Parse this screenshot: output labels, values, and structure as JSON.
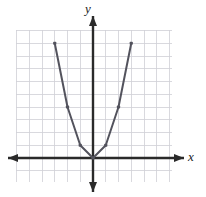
{
  "figure": {
    "title": "",
    "background_color": "#ffffff",
    "width": 206,
    "height": 197
  },
  "axes": {
    "x_label": "x",
    "y_label": "y",
    "x_label_style": "italic-serif",
    "y_label_style": "italic-serif",
    "axis_color": "#2a2a2a",
    "grid_color": "#cfcfd6",
    "grid_visible": true,
    "arrowheads": [
      "left",
      "right",
      "up",
      "down"
    ],
    "tick_labels_visible": false
  },
  "curve": {
    "color": "#53535d",
    "line_width": 2,
    "marker": "square-dot",
    "marker_color": "#53535d",
    "marker_size": 3.2
  },
  "chart_data": {
    "type": "line",
    "title": "",
    "xlabel": "x",
    "ylabel": "y",
    "grid": true,
    "legend": null,
    "xlim": [
      -6.5,
      6.5
    ],
    "ylim": [
      -2,
      10.5
    ],
    "x": [
      -3,
      -2,
      -1,
      0,
      1,
      2,
      3
    ],
    "y": [
      9,
      4,
      1,
      0,
      1,
      4,
      9
    ],
    "equation": "y = x^2",
    "series": [
      {
        "name": "y = x^2",
        "x": [
          -3,
          -2,
          -1,
          0,
          1,
          2,
          3
        ],
        "values": [
          9,
          4,
          1,
          0,
          1,
          4,
          9
        ]
      }
    ],
    "points_marked": [
      {
        "x": -3,
        "y": 9
      },
      {
        "x": -2,
        "y": 4
      },
      {
        "x": -1,
        "y": 1
      },
      {
        "x": 0,
        "y": 0
      },
      {
        "x": 1,
        "y": 1
      },
      {
        "x": 2,
        "y": 4
      },
      {
        "x": 3,
        "y": 9
      }
    ]
  },
  "geometry": {
    "origin_px": {
      "x": 93,
      "y": 158
    },
    "cell_px": 12.75,
    "grid_rect_px": {
      "left": 16,
      "top": 30,
      "right": 172,
      "bottom": 182
    },
    "grid_cols": 12,
    "grid_rows": 12
  }
}
